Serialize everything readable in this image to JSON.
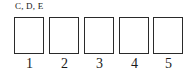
{
  "diagram": {
    "label": "C, D, E",
    "slots": [
      {
        "number": "1",
        "content": ""
      },
      {
        "number": "2",
        "content": ""
      },
      {
        "number": "3",
        "content": ""
      },
      {
        "number": "4",
        "content": ""
      },
      {
        "number": "5",
        "content": ""
      }
    ]
  }
}
